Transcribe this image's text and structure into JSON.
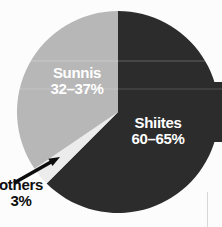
{
  "chart_data": {
    "type": "pie",
    "title": "",
    "legend_position": "none",
    "direction": "clockwise",
    "start_angle_deg": 0,
    "slices": [
      {
        "name": "Shiites",
        "range_label": "60–65%",
        "percent_range": [
          60,
          65
        ],
        "percent_mid": 62.5,
        "color": "#2c2c2c",
        "label_color": "#ffffff"
      },
      {
        "name": "others",
        "range_label": "3%",
        "percent_range": [
          3,
          3
        ],
        "percent_mid": 3,
        "color": "#ececec",
        "label_color": "#0d0d0d"
      },
      {
        "name": "Sunnis",
        "range_label": "32–37%",
        "percent_range": [
          32,
          37
        ],
        "percent_mid": 34.5,
        "color": "#b7b7b7",
        "label_color": "#ffffff"
      }
    ],
    "annotations": [
      {
        "type": "arrow",
        "points_to": "others"
      }
    ]
  }
}
